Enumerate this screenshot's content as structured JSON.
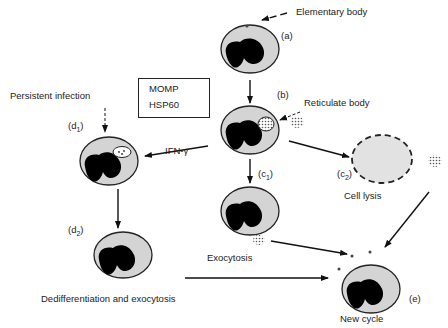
{
  "diagram": {
    "nodes": [
      {
        "id": "a",
        "label": "(a)",
        "description": "Host cell with attached elementary body"
      },
      {
        "id": "b",
        "label": "(b)",
        "description": "Host cell with reticulate body inclusion"
      },
      {
        "id": "c1",
        "label": "(c1)",
        "description": "Host cell before exocytosis"
      },
      {
        "id": "c2",
        "label": "(c2)",
        "description": "Lysed cell (dashed outline)"
      },
      {
        "id": "d1",
        "label": "(d1)",
        "description": "Persistently infected cell with aberrant inclusion"
      },
      {
        "id": "d2",
        "label": "(d2)",
        "description": "Cell after dedifferentiation"
      },
      {
        "id": "e",
        "label": "(e)",
        "description": "New host cell, new infection cycle"
      }
    ],
    "labels": {
      "elementary_body": "Elementary body",
      "reticulate_body": "Reticulate body",
      "persistent_infection": "Persistent infection",
      "ifn_gamma": "IFN-γ",
      "cell_lysis": "Cell lysis",
      "exocytosis": "Exocytosis",
      "dediff": "Dedifferentiation and exocytosis",
      "new_cycle": "New cycle"
    },
    "node_labels": {
      "a": "(a)",
      "b": "(b)",
      "c1_pre": "(c",
      "c1_sub": "1",
      "c1_post": ")",
      "c2_pre": "(c",
      "c2_sub": "2",
      "c2_post": ")",
      "d1_pre": "(d",
      "d1_sub": "1",
      "d1_post": ")",
      "d2_pre": "(d",
      "d2_sub": "2",
      "d2_post": ")",
      "e": "(e)"
    },
    "legend_box": {
      "items": [
        {
          "label": "MOMP",
          "direction": "down"
        },
        {
          "label": "HSP60",
          "direction": "up"
        }
      ]
    },
    "edges": [
      {
        "from": "a",
        "to": "b",
        "style": "solid"
      },
      {
        "from": "b",
        "to": "c1",
        "style": "solid"
      },
      {
        "from": "b",
        "to": "c2",
        "style": "solid"
      },
      {
        "from": "b",
        "to": "d1",
        "style": "solid",
        "label": "IFN-γ"
      },
      {
        "from": "d1",
        "to": "d2",
        "style": "solid"
      },
      {
        "from": "d2",
        "to": "e",
        "style": "solid"
      },
      {
        "from": "c1",
        "to": "e",
        "style": "solid"
      },
      {
        "from": "c2",
        "to": "e",
        "style": "solid"
      }
    ],
    "colors": {
      "cell_fill": "#d4d4d4",
      "nucleus": "#000000",
      "stroke": "#222222"
    }
  }
}
